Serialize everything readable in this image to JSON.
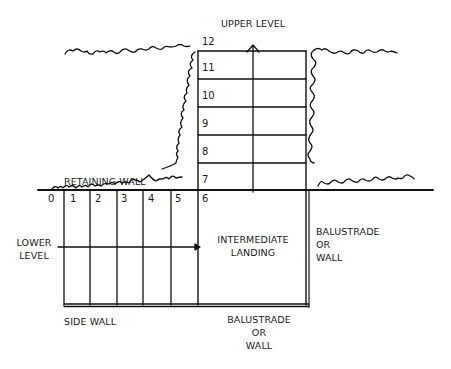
{
  "diagram": {
    "type": "stair-plan",
    "labels": {
      "upper_level": "UPPER LEVEL",
      "lower_level_line1": "LOWER",
      "lower_level_line2": "LEVEL",
      "retaining_wall": "RETAINING WALL",
      "side_wall": "SIDE WALL",
      "intermediate_landing_line1": "INTERMEDIATE",
      "intermediate_landing_line2": "LANDING",
      "balustrade_right_line1": "BALUSTRADE",
      "balustrade_right_line2": "OR",
      "balustrade_right_line3": "WALL",
      "balustrade_bottom_line1": "BALUSTRADE",
      "balustrade_bottom_line2": "OR",
      "balustrade_bottom_line3": "WALL"
    },
    "lower_flight_steps": [
      "0",
      "1",
      "2",
      "3",
      "4",
      "5",
      "6"
    ],
    "upper_flight_steps": [
      "7",
      "8",
      "9",
      "10",
      "11",
      "12"
    ],
    "line_color": "#111111"
  }
}
